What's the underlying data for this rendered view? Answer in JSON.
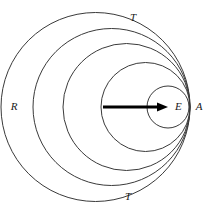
{
  "figure": {
    "background_color": "#ffffff",
    "circle_stroke_color": "#3a3a3a",
    "vector_color": "#000000",
    "label_color": "#1a1a1a",
    "width": 207,
    "height": 213
  },
  "labels": {
    "top_tangent": "T",
    "bottom_tangent": "T",
    "left_outer": "R",
    "right_tangency": "A",
    "center_point": "E"
  },
  "chart_data": {
    "type": "diagram",
    "tangency_point": {
      "label": "A",
      "x": 190,
      "y": 107
    },
    "circles": [
      {
        "name": "outer-circle-R",
        "label": "R",
        "cx": 95.5,
        "cy": 107,
        "r": 94.5,
        "left_edge_x": 13
      },
      {
        "name": "circle-2",
        "label": "",
        "cx": 111.5,
        "cy": 107,
        "r": 78.5,
        "left_edge_x": 45
      },
      {
        "name": "circle-3",
        "label": "",
        "cx": 126.5,
        "cy": 107,
        "r": 63.5,
        "left_edge_x": 75
      },
      {
        "name": "circle-4",
        "label": "",
        "cx": 145.5,
        "cy": 107,
        "r": 44.5,
        "left_edge_x": 113
      },
      {
        "name": "inner-circle-E",
        "label": "E",
        "cx": 168,
        "cy": 107,
        "r": 21,
        "left_edge_x": 148
      }
    ],
    "vector": {
      "name": "radius-vector",
      "from": {
        "x": 103,
        "y": 107
      },
      "to": {
        "x": 168,
        "y": 107
      },
      "head_length": 11,
      "head_width": 9,
      "direction": "right"
    },
    "label_positions": [
      {
        "text": "T",
        "x": 133,
        "y": 18,
        "anchor": "middle"
      },
      {
        "text": "T",
        "x": 128,
        "y": 197,
        "anchor": "middle"
      },
      {
        "text": "R",
        "x": 14,
        "y": 107,
        "anchor": "middle"
      },
      {
        "text": "A",
        "x": 199,
        "y": 107,
        "anchor": "middle"
      },
      {
        "text": "E",
        "x": 175,
        "y": 107,
        "anchor": "start"
      }
    ]
  }
}
